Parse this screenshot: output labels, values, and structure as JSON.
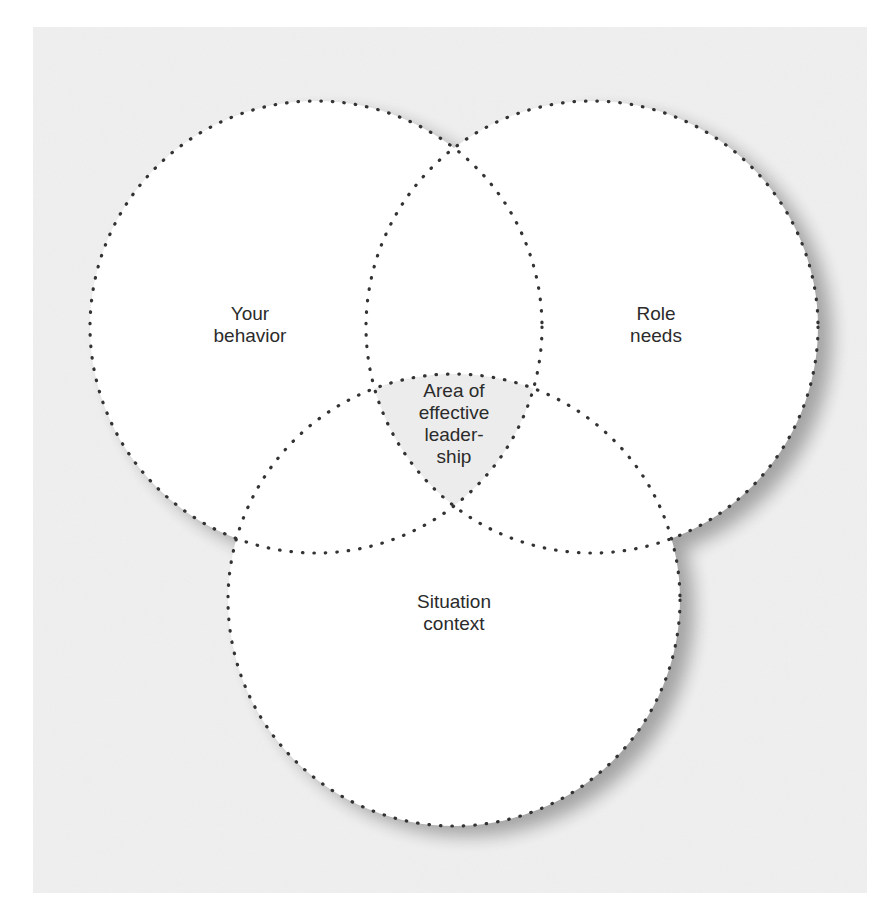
{
  "diagram": {
    "type": "venn",
    "background_color": "#f1f1f1",
    "circle_fill": "#ffffff",
    "stroke_color": "#333333",
    "intersection_fill": "#ececec",
    "circles": [
      {
        "id": "your-behavior",
        "label": "Your\nbehavior",
        "cx": 316,
        "cy": 327,
        "r": 226
      },
      {
        "id": "role-needs",
        "label": "Role\nneeds",
        "cx": 592,
        "cy": 327,
        "r": 226
      },
      {
        "id": "situation-context",
        "label": "Situation\ncontext",
        "cx": 454,
        "cy": 600,
        "r": 226
      }
    ],
    "center_label": "Area of\neffective\nleader-\nship"
  }
}
